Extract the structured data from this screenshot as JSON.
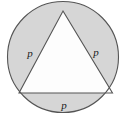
{
  "figure": {
    "background_color": "#ffffff",
    "shaded_region_color": "#d6d6d6",
    "inner_region_color": "#fdfdfd",
    "stroke_color": "#555555",
    "stroke_width": 1.1,
    "circle": {
      "center_x": 63,
      "center_y": 57,
      "radius": 56
    },
    "triangle": {
      "type": "equilateral",
      "vertices": [
        {
          "x": 63,
          "y": 11
        },
        {
          "x": 112.5,
          "y": 93
        },
        {
          "x": 19,
          "y": 93
        }
      ]
    },
    "labels": [
      {
        "id": "left",
        "text": "p",
        "x": 30,
        "y": 53
      },
      {
        "id": "right",
        "text": "p",
        "x": 96,
        "y": 52
      },
      {
        "id": "bottom",
        "text": "p",
        "x": 64,
        "y": 105
      }
    ]
  }
}
